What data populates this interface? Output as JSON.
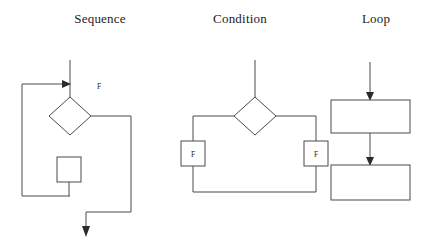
{
  "figure": {
    "background": "#ffffff",
    "stroke_color": "#4a4a4a",
    "arrow_color": "#2b2b2b",
    "text_color": "#1c1c1c",
    "width": 429,
    "height": 245
  },
  "panels": [
    {
      "id": "sequence",
      "title": "Sequence",
      "labels": [
        {
          "name": "false-branch-label",
          "text": "F"
        }
      ],
      "shapes": [
        {
          "name": "decision-diamond",
          "type": "diamond"
        },
        {
          "name": "action-box",
          "type": "rect"
        }
      ],
      "connectors": [
        {
          "name": "entry-arrow",
          "type": "arrow",
          "direction": "right"
        },
        {
          "name": "loop-back-path",
          "type": "polyline"
        },
        {
          "name": "false-exit-path",
          "type": "polyline"
        },
        {
          "name": "exit-arrow",
          "type": "arrow",
          "direction": "down"
        }
      ]
    },
    {
      "id": "condition",
      "title": "Condition",
      "labels": [
        {
          "name": "left-branch-label",
          "text": "F"
        },
        {
          "name": "right-branch-label",
          "text": "F"
        }
      ],
      "shapes": [
        {
          "name": "decision-diamond",
          "type": "diamond"
        },
        {
          "name": "left-f-box",
          "type": "rect"
        },
        {
          "name": "right-f-box",
          "type": "rect"
        }
      ],
      "connectors": [
        {
          "name": "entry-line",
          "type": "line",
          "direction": "down"
        },
        {
          "name": "left-branch-path",
          "type": "polyline"
        },
        {
          "name": "right-branch-path",
          "type": "polyline"
        },
        {
          "name": "merge-path",
          "type": "polyline"
        }
      ]
    },
    {
      "id": "loop",
      "title": "Loop",
      "labels": [],
      "shapes": [
        {
          "name": "first-box",
          "type": "rect"
        },
        {
          "name": "second-box",
          "type": "rect"
        }
      ],
      "connectors": [
        {
          "name": "entry-arrow",
          "type": "arrow",
          "direction": "down"
        },
        {
          "name": "between-boxes-arrow",
          "type": "arrow",
          "direction": "down"
        }
      ]
    }
  ]
}
